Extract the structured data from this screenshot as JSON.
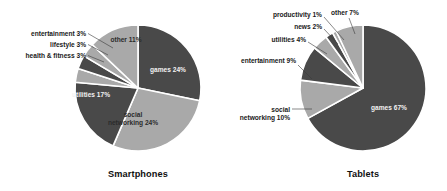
{
  "figure": {
    "width": 447,
    "height": 191,
    "background": "#ffffff"
  },
  "palette": {
    "dark": "#494949",
    "light": "#a9a9a9",
    "separator": "#ffffff",
    "text_dark": "#1a1a1a",
    "text_on_dark": "#f2f2f2",
    "text_on_light": "#2b2b2b",
    "leader_line": "#3b3b3b"
  },
  "chart_data": [
    {
      "type": "pie",
      "title": "Smartphones",
      "xlabel": "",
      "ylabel": "",
      "legend": "none",
      "grid": false,
      "start_angle_deg": 0,
      "direction": "clockwise",
      "center": {
        "x": 138,
        "y": 88
      },
      "radius": 63,
      "categories": [
        "games",
        "social networking",
        "utilities",
        "health & fitness",
        "lifestyle",
        "entertainment",
        "other"
      ],
      "values": [
        24,
        24,
        17,
        3,
        3,
        3,
        11
      ],
      "units": "%",
      "slices": [
        {
          "name": "games",
          "label": "games 24%",
          "value": 24,
          "color": "dark",
          "label_placement": "inside",
          "label_lines": [
            "games 24%"
          ],
          "label_x": 168,
          "label_y": 72,
          "text_anchor": "middle"
        },
        {
          "name": "social networking",
          "label": "social networking 24%",
          "value": 24,
          "color": "light",
          "label_placement": "inside",
          "label_lines": [
            "social",
            "networking 24%"
          ],
          "label_x": 133,
          "label_y": 117,
          "text_anchor": "middle"
        },
        {
          "name": "utilities",
          "label": "utilities 17%",
          "value": 17,
          "color": "dark",
          "label_placement": "inside",
          "label_lines": [
            "utilities 17%"
          ],
          "label_x": 91,
          "label_y": 97,
          "text_anchor": "middle"
        },
        {
          "name": "health & fitness",
          "label": "health & fitness 3%",
          "value": 3,
          "color": "light",
          "label_placement": "outside",
          "label_lines": [
            "health & fitness 3%"
          ],
          "label_x": 86,
          "label_y": 58,
          "text_anchor": "end",
          "leader": [
            [
              88,
              55.5
            ],
            [
              104,
              62
            ]
          ]
        },
        {
          "name": "lifestyle",
          "label": "lifestyle 3%",
          "value": 3,
          "color": "dark",
          "label_placement": "outside",
          "label_lines": [
            "lifestyle 3%"
          ],
          "label_x": 86,
          "label_y": 47,
          "text_anchor": "end",
          "leader": [
            [
              88,
              44.5
            ],
            [
              108,
              55
            ]
          ]
        },
        {
          "name": "entertainment",
          "label": "entertainment 3%",
          "value": 3,
          "color": "light",
          "label_placement": "outside",
          "label_lines": [
            "entertainment 3%"
          ],
          "label_x": 86,
          "label_y": 36,
          "text_anchor": "end",
          "leader": [
            [
              88,
              33.5
            ],
            [
              113,
              48
            ]
          ]
        },
        {
          "name": "other",
          "label": "other 11%",
          "value": 11,
          "color": "light",
          "label_placement": "inside",
          "label_lines": [
            "other 11%"
          ],
          "label_x": 126,
          "label_y": 42,
          "text_anchor": "middle"
        }
      ],
      "title_x": 138,
      "title_y": 177
    },
    {
      "type": "pie",
      "title": "Tablets",
      "xlabel": "",
      "ylabel": "",
      "legend": "none",
      "grid": false,
      "start_angle_deg": 0,
      "direction": "clockwise",
      "center": {
        "x": 363,
        "y": 88
      },
      "radius": 63,
      "categories": [
        "games",
        "social networking",
        "entertainment",
        "utilities",
        "news",
        "productivity",
        "other"
      ],
      "values": [
        67,
        10,
        9,
        4,
        2,
        1,
        7
      ],
      "units": "%",
      "slices": [
        {
          "name": "games",
          "label": "games 67%",
          "value": 67,
          "color": "dark",
          "label_placement": "inside",
          "label_y": 110,
          "label_x": 389,
          "label_lines": [
            "games 67%"
          ],
          "text_anchor": "middle"
        },
        {
          "name": "social networking",
          "label": "social networking 10%",
          "value": 10,
          "color": "light",
          "label_placement": "outside",
          "label_lines": [
            "social",
            "networking 10%"
          ],
          "label_x": 290,
          "label_y": 112,
          "text_anchor": "end",
          "leader": [
            [
              292,
              109
            ],
            [
              312,
              109
            ]
          ]
        },
        {
          "name": "entertainment",
          "label": "entertainment 9%",
          "value": 9,
          "color": "dark",
          "label_placement": "outside",
          "label_lines": [
            "entertainment 9%"
          ],
          "label_x": 296,
          "label_y": 63,
          "text_anchor": "end",
          "leader": [
            [
              298,
              65
            ],
            [
              312,
              79
            ]
          ]
        },
        {
          "name": "utilities",
          "label": "utilities 4%",
          "value": 4,
          "color": "light",
          "label_placement": "outside",
          "label_lines": [
            "utilities 4%"
          ],
          "label_x": 306,
          "label_y": 42,
          "text_anchor": "end",
          "leader": [
            [
              308,
              42
            ],
            [
              327,
              54
            ]
          ]
        },
        {
          "name": "news",
          "label": "news 2%",
          "value": 2,
          "color": "dark",
          "label_placement": "outside",
          "label_lines": [
            "news 2%"
          ],
          "label_x": 322,
          "label_y": 29,
          "text_anchor": "end",
          "leader": [
            [
              324,
              29
            ],
            [
              338,
              44
            ]
          ]
        },
        {
          "name": "productivity",
          "label": "productivity 1%",
          "value": 1,
          "color": "light",
          "label_placement": "outside",
          "label_lines": [
            "productivity 1%"
          ],
          "label_x": 322,
          "label_y": 17,
          "text_anchor": "end",
          "leader": [
            [
              324,
              17
            ],
            [
              344,
              40
            ]
          ]
        },
        {
          "name": "other",
          "label": "other 7%",
          "value": 7,
          "color": "light",
          "label_placement": "outside",
          "label_lines": [
            "other 7%"
          ],
          "label_x": 331,
          "label_y": 15,
          "text_anchor": "start",
          "leader": [
            [
              349,
              18
            ],
            [
              355,
              34
            ]
          ]
        }
      ],
      "title_x": 363,
      "title_y": 177
    }
  ]
}
